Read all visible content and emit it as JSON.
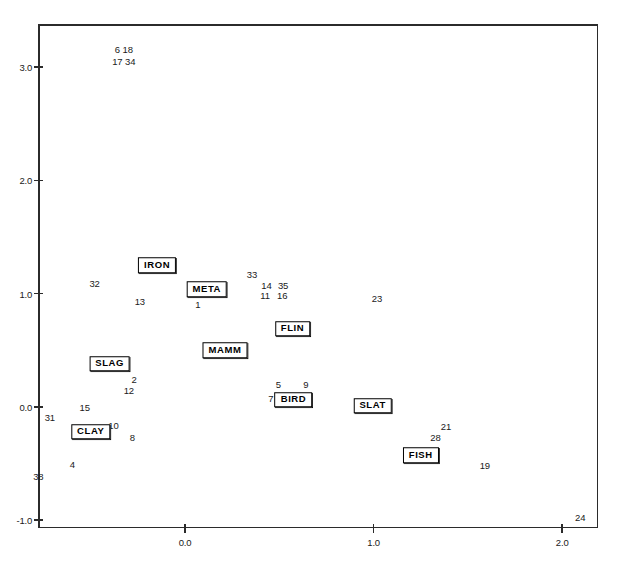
{
  "chart_data": {
    "type": "scatter",
    "title": "",
    "xlabel": "",
    "ylabel": "",
    "xlim": [
      -0.78,
      2.19
    ],
    "ylim": [
      -1.07,
      3.38
    ],
    "grid": false,
    "legend": "none",
    "xticks": [
      {
        "value": 0.0,
        "label": "0.0"
      },
      {
        "value": 1.0,
        "label": "1.0"
      },
      {
        "value": 2.0,
        "label": "2.0"
      }
    ],
    "yticks": [
      {
        "value": -1.0,
        "label": "-1.0"
      },
      {
        "value": 0.0,
        "label": "0.0"
      },
      {
        "value": 1.0,
        "label": "1.0"
      },
      {
        "value": 2.0,
        "label": "2.0"
      },
      {
        "value": 3.0,
        "label": "3.0"
      }
    ],
    "point_labels": [
      {
        "text": "6 18",
        "x": -0.325,
        "y": 3.155
      },
      {
        "text": "17 34",
        "x": -0.325,
        "y": 3.055
      },
      {
        "text": "32",
        "x": -0.48,
        "y": 1.09
      },
      {
        "text": "13",
        "x": -0.24,
        "y": 0.93
      },
      {
        "text": "33",
        "x": 0.355,
        "y": 1.175
      },
      {
        "text": "14",
        "x": 0.432,
        "y": 1.077
      },
      {
        "text": "35",
        "x": 0.52,
        "y": 1.077
      },
      {
        "text": "11",
        "x": 0.425,
        "y": 0.988
      },
      {
        "text": "16",
        "x": 0.515,
        "y": 0.988
      },
      {
        "text": "1",
        "x": 0.068,
        "y": 0.91
      },
      {
        "text": "23",
        "x": 1.018,
        "y": 0.96
      },
      {
        "text": "5",
        "x": 0.495,
        "y": 0.198
      },
      {
        "text": "9",
        "x": 0.64,
        "y": 0.198
      },
      {
        "text": "7",
        "x": 0.455,
        "y": 0.075
      },
      {
        "text": "2",
        "x": -0.27,
        "y": 0.248
      },
      {
        "text": "12",
        "x": -0.298,
        "y": 0.15
      },
      {
        "text": "15",
        "x": -0.532,
        "y": 0.0
      },
      {
        "text": "31",
        "x": -0.717,
        "y": -0.088
      },
      {
        "text": "10",
        "x": -0.38,
        "y": -0.163
      },
      {
        "text": "8",
        "x": -0.28,
        "y": -0.267
      },
      {
        "text": "4",
        "x": -0.598,
        "y": -0.502
      },
      {
        "text": "38",
        "x": -0.778,
        "y": -0.608
      },
      {
        "text": "21",
        "x": 1.384,
        "y": -0.172
      },
      {
        "text": "28",
        "x": 1.328,
        "y": -0.268
      },
      {
        "text": "19",
        "x": 1.59,
        "y": -0.512
      },
      {
        "text": "24",
        "x": 2.096,
        "y": -0.973
      }
    ],
    "group_labels": [
      {
        "text": "IRON",
        "x": -0.148,
        "y": 1.25
      },
      {
        "text": "META",
        "x": 0.115,
        "y": 1.04
      },
      {
        "text": "FLIN",
        "x": 0.57,
        "y": 0.69
      },
      {
        "text": "MAMM",
        "x": 0.212,
        "y": 0.498
      },
      {
        "text": "SLAG",
        "x": -0.4,
        "y": 0.38
      },
      {
        "text": "BIRD",
        "x": 0.575,
        "y": 0.062
      },
      {
        "text": "SLAT",
        "x": 0.995,
        "y": 0.008
      },
      {
        "text": "CLAY",
        "x": -0.5,
        "y": -0.222
      },
      {
        "text": "FISH",
        "x": 1.25,
        "y": -0.428
      }
    ]
  },
  "colors": {
    "axis": "#2b2b2b",
    "text": "#1a1a1a",
    "box_border": "#000000",
    "background": "#ffffff"
  }
}
